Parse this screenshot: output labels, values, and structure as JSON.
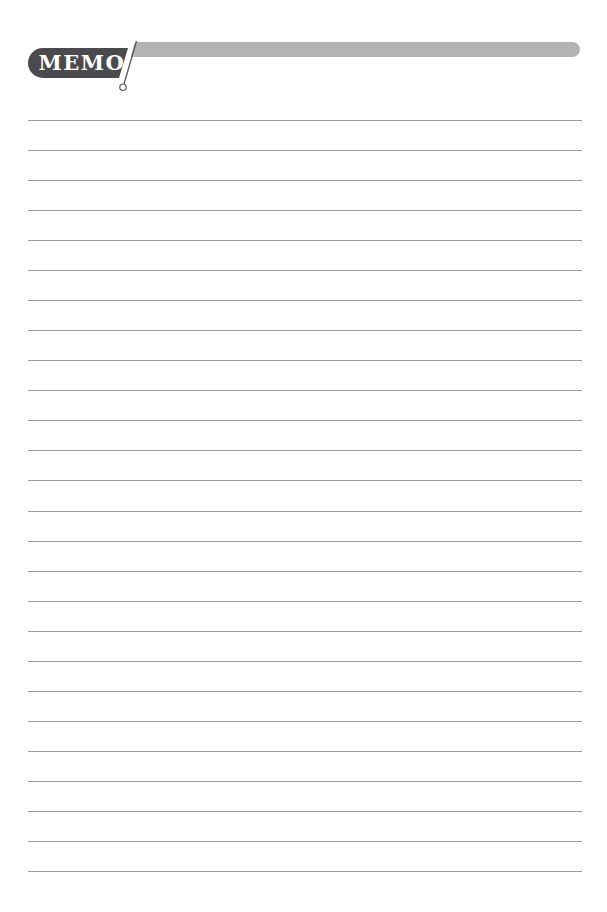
{
  "header": {
    "title": "MEMO",
    "badge_color": "#4a4a4f",
    "bar_color": "#b3b3b3",
    "slash_color": "#55555a"
  },
  "ruled_lines": {
    "count": 26,
    "color": "#9c9c9c"
  }
}
